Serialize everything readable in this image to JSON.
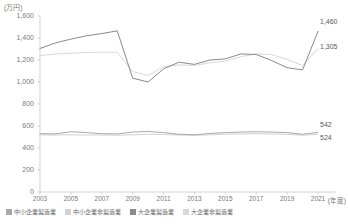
{
  "chart_data": {
    "type": "line",
    "title": "",
    "xlabel": "(年度)",
    "ylabel": "(万円)",
    "unit_y": "(万円)",
    "unit_x": "(年度)",
    "grid": false,
    "legend_position": "bottom",
    "ylim": [
      0,
      1600
    ],
    "yticks": [
      "0",
      "200",
      "400",
      "600",
      "800",
      "1,000",
      "1,200",
      "1,400",
      "1,600"
    ],
    "ytick_values": [
      0,
      200,
      400,
      600,
      800,
      1000,
      1200,
      1400,
      1600
    ],
    "x": [
      2003,
      2004,
      2005,
      2006,
      2007,
      2008,
      2009,
      2010,
      2011,
      2012,
      2013,
      2014,
      2015,
      2016,
      2017,
      2018,
      2019,
      2020,
      2021
    ],
    "xticks": [
      "2003",
      "2005",
      "2007",
      "2009",
      "2011",
      "2013",
      "2015",
      "2017",
      "2019",
      "2021"
    ],
    "xtick_values": [
      2003,
      2005,
      2007,
      2009,
      2011,
      2013,
      2015,
      2017,
      2019,
      2021
    ],
    "series": [
      {
        "name": "中小企業製造業",
        "color": "#a8a8a8",
        "values": [
          530,
          528,
          548,
          540,
          530,
          528,
          545,
          550,
          540,
          525,
          520,
          532,
          540,
          545,
          548,
          545,
          540,
          525,
          542
        ]
      },
      {
        "name": "中小企業非製造業",
        "color": "#d2d2d2",
        "values": [
          520,
          518,
          520,
          518,
          518,
          516,
          520,
          525,
          522,
          518,
          515,
          520,
          525,
          528,
          530,
          528,
          524,
          516,
          524
        ]
      },
      {
        "name": "大企業製造業",
        "color": "#8a8a8a",
        "values": [
          1305,
          1355,
          1390,
          1420,
          1440,
          1465,
          1035,
          1000,
          1120,
          1180,
          1160,
          1200,
          1210,
          1255,
          1250,
          1195,
          1130,
          1110,
          1460
        ]
      },
      {
        "name": "大企業非製造業",
        "color": "#d8d8d8",
        "values": [
          1240,
          1255,
          1262,
          1268,
          1272,
          1270,
          1095,
          1060,
          1140,
          1155,
          1150,
          1175,
          1190,
          1230,
          1255,
          1250,
          1205,
          1150,
          1305
        ]
      }
    ],
    "annotations": [
      {
        "text": "1,460",
        "series": "大企業製造業",
        "x": 2021,
        "value": 1460
      },
      {
        "text": "1,305",
        "series": "大企業非製造業",
        "x": 2021,
        "value": 1305
      },
      {
        "text": "542",
        "series": "中小企業製造業",
        "x": 2021,
        "value": 542
      },
      {
        "text": "524",
        "series": "中小企業非製造業",
        "x": 2021,
        "value": 524
      }
    ]
  }
}
